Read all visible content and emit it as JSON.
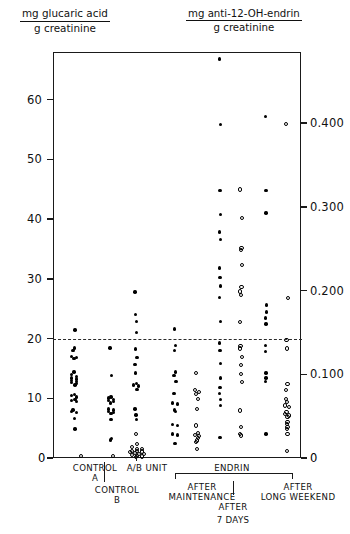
{
  "titles": {
    "left": {
      "numerator": "mg glucaric acid",
      "denominator": "g creatinine"
    },
    "right": {
      "numerator": "mg anti-12-OH-endrin",
      "denominator": "g creatinine"
    }
  },
  "axes": {
    "left": {
      "ticks": [
        "0",
        "10",
        "20",
        "30",
        "40",
        "50",
        "60"
      ]
    },
    "right": {
      "ticks": [
        "0",
        "0.100",
        "0.200",
        "0.300",
        "0.400"
      ]
    }
  },
  "groups": {
    "control_a": "CONTROL\nA",
    "control_a_line1": "CONTROL",
    "control_a_line2": "A",
    "control_b_line1": "CONTROL",
    "control_b_line2": "B",
    "ab_unit": "A/B UNIT",
    "endrin": "ENDRIN",
    "after_maintenance_line1": "AFTER",
    "after_maintenance_line2": "MAINTENANCE",
    "after_7days_line1": "AFTER",
    "after_7days_line2": "7 DAYS",
    "after_long_weekend_line1": "AFTER",
    "after_long_weekend_line2": "LONG WEEKEND"
  },
  "chart_data": {
    "type": "scatter",
    "xlabel": "",
    "ylabel": "mg glucaric acid / g creatinine",
    "ylabel_right": "mg anti-12-OH-endrin / g creatinine",
    "ylim": [
      0,
      68
    ],
    "ylim_right": [
      0,
      0.485
    ],
    "grid": false,
    "legend": null,
    "annotations": [
      {
        "type": "hline",
        "value": 20,
        "style": "dashed",
        "label": "upper normal limit"
      }
    ],
    "marker_meaning": {
      "filled": "mg glucaric acid / g creatinine (left axis)",
      "open": "mg anti-12-OH-endrin / g creatinine (right axis)"
    },
    "series": [
      {
        "name": "Control A - glucaric acid",
        "group": "CONTROL A",
        "marker": "filled",
        "axis": "left",
        "values": [
          21.6,
          18.6,
          18.2,
          17.2,
          17.0,
          16.8,
          14.6,
          14.2,
          13.8,
          13.6,
          13.4,
          13.2,
          13.0,
          12.8,
          12.6,
          12.4,
          10.8,
          10.6,
          10.4,
          10.0,
          9.8,
          9.6,
          8.2,
          8.0,
          7.8,
          6.8,
          5.0
        ]
      },
      {
        "name": "Control A - anti-12-OH-endrin",
        "group": "CONTROL A",
        "marker": "open",
        "axis": "right",
        "values": [
          0.004
        ]
      },
      {
        "name": "Control B - glucaric acid",
        "group": "CONTROL B",
        "marker": "filled",
        "axis": "left",
        "values": [
          18.6,
          14.0,
          10.4,
          10.2,
          10.0,
          9.8,
          9.6,
          9.4,
          8.4,
          8.2,
          8.0,
          7.8,
          7.6,
          6.6,
          3.4,
          3.2
        ]
      },
      {
        "name": "Control B - anti-12-OH-endrin",
        "group": "CONTROL B",
        "marker": "open",
        "axis": "right",
        "values": [
          0.004
        ]
      },
      {
        "name": "A/B Unit - glucaric acid",
        "group": "A/B UNIT",
        "marker": "filled",
        "axis": "left",
        "values": [
          28.0,
          24.2,
          23.0,
          21.2,
          18.4,
          17.0,
          15.8,
          14.4,
          12.6,
          12.4,
          12.2,
          11.6,
          8.4,
          7.4,
          6.6
        ]
      },
      {
        "name": "A/B Unit - anti-12-OH-endrin",
        "group": "A/B UNIT",
        "marker": "open",
        "axis": "right",
        "values": [
          0.03,
          0.018,
          0.014,
          0.012,
          0.012,
          0.01,
          0.01,
          0.009,
          0.008,
          0.007,
          0.006,
          0.006,
          0.005,
          0.004,
          0.003,
          0.002
        ]
      },
      {
        "name": "Endrin after maintenance - glucaric acid",
        "group": "ENDRIN AFTER MAINTENANCE",
        "marker": "filled",
        "axis": "left",
        "values": [
          21.8,
          19.0,
          18.2,
          14.6,
          14.0,
          13.0,
          11.0,
          9.4,
          9.2,
          8.2,
          8.0,
          5.8,
          5.6,
          4.2,
          4.0,
          2.6
        ]
      },
      {
        "name": "Endrin after maintenance - anti-12-OH-endrin",
        "group": "ENDRIN AFTER MAINTENANCE",
        "marker": "open",
        "axis": "right",
        "values": [
          0.103,
          0.082,
          0.08,
          0.078,
          0.072,
          0.06,
          0.04,
          0.031,
          0.029,
          0.027,
          0.025,
          0.022,
          0.02,
          0.012
        ]
      },
      {
        "name": "Endrin after 7 days - glucaric acid",
        "group": "ENDRIN AFTER 7 DAYS",
        "marker": "filled",
        "axis": "left",
        "values": [
          67.0,
          56.0,
          45.0,
          41.0,
          38.0,
          36.8,
          32.0,
          30.4,
          29.0,
          27.0,
          23.0,
          19.4,
          18.2,
          16.0,
          13.6,
          12.0,
          11.0,
          10.0,
          9.0,
          3.6
        ]
      },
      {
        "name": "Endrin after 7 days - anti-12-OH-endrin",
        "group": "ENDRIN AFTER 7 DAYS",
        "marker": "open",
        "axis": "right",
        "values": [
          0.322,
          0.288,
          0.252,
          0.25,
          0.232,
          0.205,
          0.2,
          0.196,
          0.164,
          0.135,
          0.132,
          0.122,
          0.112,
          0.102,
          0.092,
          0.058,
          0.038,
          0.03,
          0.028
        ]
      },
      {
        "name": "Endrin after long weekend - glucaric acid",
        "group": "ENDRIN AFTER LONG WEEKEND",
        "marker": "filled",
        "axis": "left",
        "values": [
          57.4,
          45.0,
          41.2,
          25.8,
          24.6,
          23.6,
          22.6,
          19.0,
          18.0,
          14.4,
          13.6,
          13.0,
          4.2
        ]
      },
      {
        "name": "Endrin after long weekend - anti-12-OH-endrin",
        "group": "ENDRIN AFTER LONG WEEKEND",
        "marker": "open",
        "axis": "right",
        "values": [
          0.4,
          0.192,
          0.142,
          0.132,
          0.09,
          0.082,
          0.072,
          0.068,
          0.064,
          0.062,
          0.056,
          0.054,
          0.052,
          0.05,
          0.044,
          0.042,
          0.038,
          0.036,
          0.03,
          0.01
        ]
      }
    ]
  },
  "colors": {
    "ink": "#111111",
    "marker": "#000000",
    "frame": "#1a1a1a"
  }
}
